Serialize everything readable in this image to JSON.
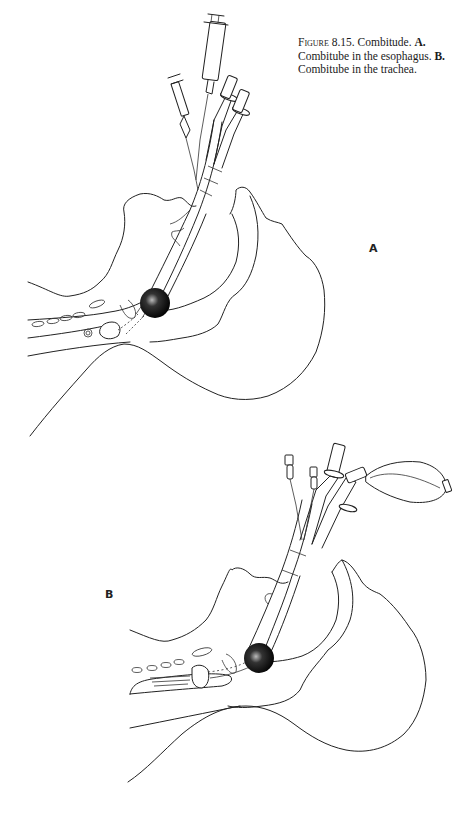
{
  "caption": {
    "figure_label": "Figure",
    "figure_number": "8.15.",
    "title": "Combitude.",
    "part_a_label": "A.",
    "part_a_text": "Combitube in the esophagus.",
    "part_b_label": "B.",
    "part_b_text": "Combitube in the trachea."
  },
  "panels": [
    {
      "label": "A",
      "description": "Combitube inserted with distal balloon positioned in the esophagus; two syringes attached to pilot balloons and two tube connectors above the mouth"
    },
    {
      "label": "B",
      "description": "Combitube inserted with distal tip in the trachea; ventilation bag attached to one connector, two pilot-balloon valves above"
    }
  ],
  "colors": {
    "line": "#222222",
    "cuff": "#111111",
    "background": "#ffffff"
  }
}
